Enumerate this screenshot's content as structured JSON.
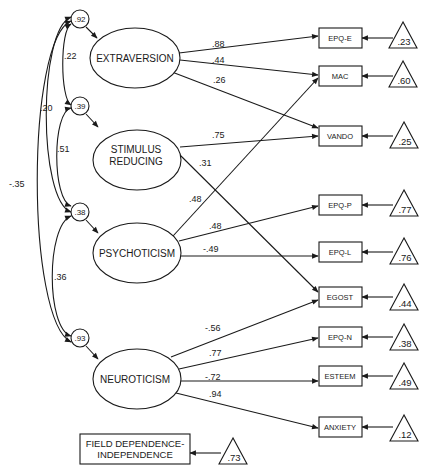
{
  "diagram": {
    "type": "structural-equation-model",
    "latent_factors": [
      {
        "id": "extraversion",
        "label": "EXTRAVERSION",
        "label_lines": [
          "EXTRAVERSION"
        ],
        "disturbance": ".92"
      },
      {
        "id": "stimulus_reducing",
        "label": "STIMULUS REDUCING",
        "label_lines": [
          "STIMULUS",
          "REDUCING"
        ],
        "disturbance": ".39"
      },
      {
        "id": "psychoticism",
        "label": "PSYCHOTICISM",
        "label_lines": [
          "PSYCHOTICISM"
        ],
        "disturbance": ".38"
      },
      {
        "id": "neuroticism",
        "label": "NEUROTICISM",
        "label_lines": [
          "NEUROTICISM"
        ],
        "disturbance": ".93"
      }
    ],
    "indicators": [
      {
        "id": "epq_e",
        "label": "EPQ-E",
        "error": ".23"
      },
      {
        "id": "mac",
        "label": "MAC",
        "error": ".60"
      },
      {
        "id": "vando",
        "label": "VANDO",
        "error": ".25"
      },
      {
        "id": "epq_p",
        "label": "EPQ-P",
        "error": ".77"
      },
      {
        "id": "epq_l",
        "label": "EPQ-L",
        "error": ".76"
      },
      {
        "id": "egost",
        "label": "EGOST",
        "error": ".44"
      },
      {
        "id": "epq_n",
        "label": "EPQ-N",
        "error": ".38"
      },
      {
        "id": "esteem",
        "label": "ESTEEM",
        "error": ".49"
      },
      {
        "id": "anxiety",
        "label": "ANXIETY",
        "error": ".12"
      }
    ],
    "loadings": [
      {
        "from": "EXTRAVERSION",
        "to": "EPQ-E",
        "value": ".88"
      },
      {
        "from": "EXTRAVERSION",
        "to": "MAC",
        "value": ".44"
      },
      {
        "from": "EXTRAVERSION",
        "to": "VANDO",
        "value": ".26"
      },
      {
        "from": "STIMULUS REDUCING",
        "to": "VANDO",
        "value": ".75"
      },
      {
        "from": "STIMULUS REDUCING",
        "to": "EGOST",
        "value": ".31"
      },
      {
        "from": "PSYCHOTICISM",
        "to": "MAC",
        "value": ".48"
      },
      {
        "from": "PSYCHOTICISM",
        "to": "EPQ-P",
        "value": ".48"
      },
      {
        "from": "PSYCHOTICISM",
        "to": "EPQ-L",
        "value": "-.49"
      },
      {
        "from": "NEUROTICISM",
        "to": "EGOST",
        "value": "-.56"
      },
      {
        "from": "NEUROTICISM",
        "to": "EPQ-N",
        "value": ".77"
      },
      {
        "from": "NEUROTICISM",
        "to": "ESTEEM",
        "value": "-.72"
      },
      {
        "from": "NEUROTICISM",
        "to": "ANXIETY",
        "value": ".94"
      }
    ],
    "correlations": [
      {
        "between": [
          ".92",
          ".39"
        ],
        "value": ".22"
      },
      {
        "between": [
          ".92",
          ".38"
        ],
        "value": ".20"
      },
      {
        "between": [
          ".39",
          ".38"
        ],
        "value": ".51"
      },
      {
        "between": [
          ".92",
          ".93"
        ],
        "value": "-.35"
      },
      {
        "between": [
          ".38",
          ".93"
        ],
        "value": ".36"
      }
    ],
    "standalone": {
      "label_lines": [
        "FIELD DEPENDENCE-",
        "INDEPENDENCE"
      ],
      "error": ".73"
    }
  }
}
